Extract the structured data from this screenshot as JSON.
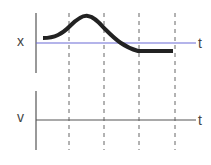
{
  "top_graph": {
    "y_label": "x",
    "t_label": "t",
    "axis_color": "#6b6bd6",
    "curve_color": "#222222"
  },
  "bottom_graph": {
    "y_label": "v",
    "t_label": "t",
    "axis_color": "#555555"
  },
  "dashed_lines": {
    "count": 4,
    "color": "#666666"
  }
}
